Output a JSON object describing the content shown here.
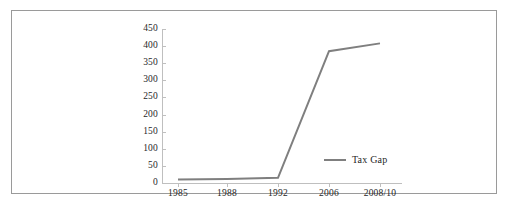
{
  "chart_data": {
    "type": "line",
    "title": "",
    "subtitle": "",
    "xlabel": "",
    "ylabel": "",
    "categories": [
      "1985",
      "1988",
      "1992",
      "2006",
      "2008/10"
    ],
    "series": [
      {
        "name": "Tax Gap",
        "values": [
          10,
          12,
          15,
          385,
          408
        ],
        "color": "#7f7f7f"
      }
    ],
    "ylim": [
      0,
      450
    ],
    "yticks": [
      0,
      50,
      100,
      150,
      200,
      250,
      300,
      350,
      400,
      450
    ],
    "ytick_labels": [
      "0",
      "50",
      "100",
      "150",
      "200",
      "250",
      "300",
      "350",
      "400",
      "450"
    ],
    "grid": false,
    "legend": {
      "position": "inside-center-right",
      "entries": [
        "Tax Gap"
      ]
    },
    "annotations": []
  },
  "legend": {
    "entry_label": "Tax Gap",
    "line_color": "#7f7f7f"
  },
  "frame": {
    "border_color": "#9a9a9a",
    "axis_color": "#bfbfbf",
    "background": "#ffffff"
  }
}
